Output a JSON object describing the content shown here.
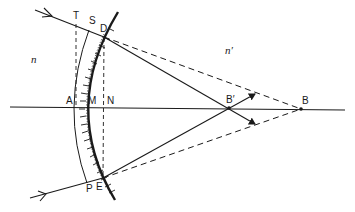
{
  "diagram": {
    "type": "optics-refraction-spherical-surface",
    "media": {
      "left_index": "n",
      "right_index": "n′"
    },
    "points": {
      "T": "T",
      "S": "S",
      "D": "D",
      "A": "A",
      "M": "M",
      "N": "N",
      "P": "P",
      "E": "E",
      "B_prime": "B′",
      "B": "B"
    },
    "colors": {
      "ink": "#1a1a1a",
      "background": "#ffffff"
    }
  }
}
